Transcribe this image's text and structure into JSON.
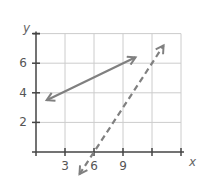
{
  "chart_data": {
    "type": "line",
    "title": "",
    "xlabel": "x",
    "ylabel": "y",
    "xlim": [
      0,
      15
    ],
    "ylim": [
      0,
      8
    ],
    "grid": true,
    "x_ticks": [
      3,
      6,
      9,
      12,
      15
    ],
    "x_tick_labels": [
      "3",
      "6",
      "9",
      "",
      ""
    ],
    "y_ticks": [
      2,
      4,
      6,
      8
    ],
    "y_tick_labels": [
      "2",
      "4",
      "6",
      ""
    ],
    "series": [
      {
        "name": "solid-line",
        "style": "solid",
        "arrows": "both",
        "x": [
          1.1,
          10.3
        ],
        "y": [
          3.5,
          6.4
        ]
      },
      {
        "name": "dashed-line",
        "style": "dashed",
        "arrows": "both",
        "x": [
          4.5,
          13.2
        ],
        "y": [
          -1.5,
          7.2
        ]
      }
    ]
  },
  "colors": {
    "grid": "#cccccc",
    "axis": "#444444",
    "line": "#808080",
    "text": "#555555"
  }
}
